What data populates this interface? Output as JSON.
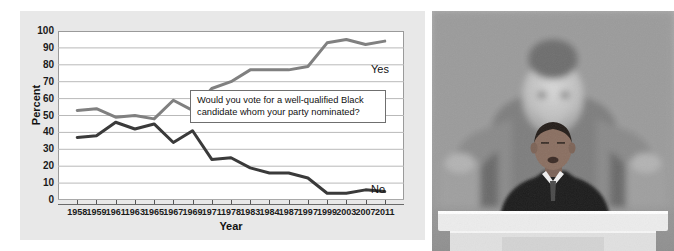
{
  "figure": {
    "background_color": "#ffffff",
    "panel_color": "#e8e8e8"
  },
  "chart_data": {
    "type": "line",
    "title": "",
    "xlabel": "Year",
    "ylabel": "Percent",
    "ylim": [
      0,
      100
    ],
    "ytick_labels": [
      "100",
      "90",
      "80",
      "70",
      "60",
      "50",
      "40",
      "30",
      "20",
      "10",
      "0"
    ],
    "ytick_values": [
      100,
      90,
      80,
      70,
      60,
      50,
      40,
      30,
      20,
      10,
      0
    ],
    "grid": true,
    "legend_position": "inline-right",
    "categories": [
      "1958",
      "1959",
      "1961",
      "1963",
      "1965",
      "1967",
      "1969",
      "1971",
      "1978",
      "1983",
      "1984",
      "1987",
      "1997",
      "1999",
      "2003",
      "2007",
      "2011"
    ],
    "series": [
      {
        "name": "Yes",
        "color": "#808080",
        "values": [
          53,
          54,
          49,
          50,
          48,
          59,
          53,
          66,
          70,
          77,
          77,
          77,
          79,
          93,
          95,
          92,
          94
        ]
      },
      {
        "name": "No",
        "color": "#3a3a3a",
        "values": [
          37,
          38,
          46,
          42,
          45,
          34,
          41,
          24,
          25,
          19,
          16,
          16,
          13,
          4,
          4,
          6,
          5
        ]
      }
    ],
    "annotations": [
      {
        "name": "survey-question",
        "line1": "Would you vote for a well-qualified Black",
        "line2": "candidate whom your party nominated?"
      }
    ]
  },
  "photo": {
    "caption": "",
    "alt_name": "speaker-at-lincoln-memorial-photo",
    "colors": {
      "sky": "#a8a8a8",
      "statue_light": "#c9c9c9",
      "statue_shadow": "#6b6b6b",
      "suit": "#1f1f1f",
      "podium": "#e2e2e2"
    }
  }
}
